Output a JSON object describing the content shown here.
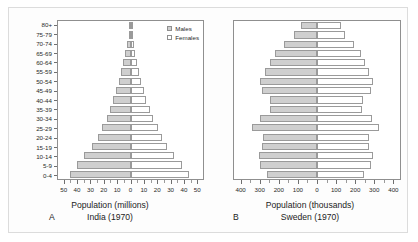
{
  "figure": {
    "background_color": "#fdfdfd",
    "border_color": "#dcdcdc"
  },
  "legend": {
    "males_label": "Males",
    "females_label": "Females",
    "male_color": "#cfcfcf",
    "female_color": "#ffffff"
  },
  "panel_a": {
    "letter": "A",
    "axis_title": "Population (millions)",
    "caption": "India (1970)"
  },
  "panel_b": {
    "letter": "B",
    "axis_title": "Population (thousands)",
    "caption": "Sweden (1970)"
  },
  "chart_data": [
    {
      "type": "bar",
      "title": "India (1970)",
      "subtitle": "A",
      "xlabel": "Population (millions)",
      "ylabel": "",
      "orientation": "population-pyramid",
      "categories": [
        "0-4",
        "5-9",
        "10-14",
        "15-19",
        "20-24",
        "25-29",
        "30-34",
        "35-39",
        "40-44",
        "45-49",
        "50-54",
        "55-59",
        "60-64",
        "65-69",
        "70-74",
        "75-79",
        "80+"
      ],
      "xlim": [
        -55,
        55
      ],
      "xticks": [
        -50,
        -40,
        -30,
        -20,
        -10,
        0,
        10,
        20,
        30,
        40,
        50
      ],
      "xticklabels": [
        "50",
        "40",
        "30",
        "20",
        "10",
        "0",
        "10",
        "20",
        "30",
        "40",
        "50"
      ],
      "grid": false,
      "legend_position": "top-right",
      "series": [
        {
          "name": "Males",
          "color": "#cfcfcf",
          "side": "left",
          "values": [
            46.0,
            40.5,
            35.0,
            29.5,
            25.0,
            21.5,
            18.0,
            15.5,
            13.0,
            11.0,
            9.0,
            7.0,
            5.5,
            4.0,
            2.6,
            1.5,
            1.0
          ]
        },
        {
          "name": "Females",
          "color": "#ffffff",
          "side": "right",
          "values": [
            44.5,
            39.0,
            33.0,
            28.0,
            24.0,
            20.5,
            17.0,
            14.5,
            12.0,
            10.0,
            8.0,
            6.5,
            5.0,
            3.6,
            2.4,
            1.4,
            1.0
          ]
        }
      ]
    },
    {
      "type": "bar",
      "title": "Sweden (1970)",
      "subtitle": "B",
      "xlabel": "Population (thousands)",
      "ylabel": "",
      "orientation": "population-pyramid",
      "categories": [
        "0-4",
        "5-9",
        "10-14",
        "15-19",
        "20-24",
        "25-29",
        "30-34",
        "35-39",
        "40-44",
        "45-49",
        "50-54",
        "55-59",
        "60-64",
        "65-69",
        "70-74",
        "75-79",
        "80+"
      ],
      "xlim": [
        -440,
        440
      ],
      "xticks": [
        -400,
        -300,
        -200,
        -100,
        0,
        100,
        200,
        300,
        400
      ],
      "xticklabels": [
        "400",
        "300",
        "200",
        "100",
        "0",
        "100",
        "200",
        "300",
        "400"
      ],
      "grid": false,
      "legend_position": "none",
      "series": [
        {
          "name": "Males",
          "color": "#cfcfcf",
          "side": "left",
          "values": [
            265,
            300,
            310,
            290,
            285,
            345,
            300,
            250,
            250,
            290,
            300,
            275,
            250,
            225,
            175,
            120,
            85
          ]
        },
        {
          "name": "Females",
          "color": "#ffffff",
          "side": "right",
          "values": [
            250,
            285,
            295,
            275,
            275,
            330,
            290,
            240,
            245,
            285,
            295,
            275,
            255,
            235,
            195,
            150,
            125
          ]
        }
      ]
    }
  ]
}
